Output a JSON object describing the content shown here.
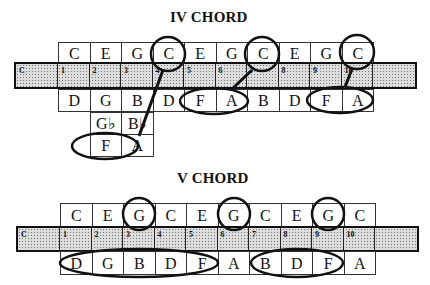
{
  "iv_chord": {
    "title": "IV CHORD",
    "top_row": [
      "C",
      "E",
      "G",
      "C",
      "E",
      "G",
      "C",
      "E",
      "G",
      "C"
    ],
    "bar_labels": [
      "C",
      "1",
      "2",
      "3",
      "4",
      "5",
      "6",
      "7",
      "8",
      "9",
      "10"
    ],
    "row2": [
      "D",
      "G",
      "B",
      "D",
      "F",
      "A",
      "B",
      "D",
      "F",
      "A"
    ],
    "row3": [
      "G♭",
      "B♭"
    ],
    "row4": [
      "F",
      "A"
    ]
  },
  "v_chord": {
    "title": "V CHORD",
    "top_row": [
      "C",
      "E",
      "G",
      "C",
      "E",
      "G",
      "C",
      "E",
      "G",
      "C"
    ],
    "bar_labels": [
      "C",
      "1",
      "2",
      "3",
      "4",
      "5",
      "6",
      "7",
      "8",
      "9",
      "10"
    ],
    "bottom_row": [
      "D",
      "G",
      "B",
      "D",
      "F",
      "A",
      "B",
      "D",
      "F",
      "A"
    ]
  }
}
